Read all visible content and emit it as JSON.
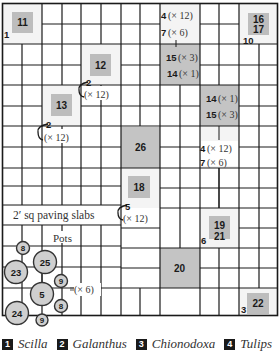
{
  "diagram": {
    "paving_label": "2′ sq paving slabs",
    "pots_label": "Pots",
    "colors": {
      "grid_line": "#1a1a1a",
      "block_fill": "#c4c4c4",
      "plot_white": "#f4f4f4",
      "pot_fill": "#cfcfcf"
    },
    "blocks": [
      {
        "id": "11",
        "text": "11"
      },
      {
        "id": "12",
        "text": "12"
      },
      {
        "id": "13",
        "text": "13"
      },
      {
        "id": "16-17",
        "line1": "16",
        "line2": "17"
      },
      {
        "id": "15-14-top",
        "line1": "15",
        "line1_qty": "(× 3)",
        "line2": "14",
        "line2_qty": "(× 1)"
      },
      {
        "id": "14-15-right",
        "line1": "14",
        "line1_qty": "(× 1)",
        "line2": "15",
        "line2_qty": "(× 3)"
      },
      {
        "id": "26",
        "text": "26"
      },
      {
        "id": "18",
        "text": "18"
      },
      {
        "id": "19-21",
        "line1": "19",
        "line2": "21"
      },
      {
        "id": "20",
        "text": "20"
      },
      {
        "id": "22",
        "text": "22"
      }
    ],
    "bed_annotations": {
      "top_center": {
        "line1": "4",
        "line1_qty": "(× 12)",
        "line2": "7",
        "line2_qty": "(× 6)"
      },
      "mid_right": {
        "line1": "4",
        "line1_qty": "(× 12)",
        "line2": "7",
        "line2_qty": "(× 6)"
      },
      "bulb_2a": {
        "num": "2",
        "qty": "(× 12)"
      },
      "bulb_2b": {
        "num": "2",
        "qty": "(× 12)"
      },
      "bulb_5": {
        "num": "5",
        "qty": "(× 12)"
      },
      "pots_qty": "(× 6)"
    },
    "corner_labels": {
      "c1": "1",
      "c10": "10",
      "c6": "6",
      "c3": "3"
    },
    "pots": [
      {
        "text": "8"
      },
      {
        "text": "25"
      },
      {
        "text": "23"
      },
      {
        "text": "9"
      },
      {
        "text": "5"
      },
      {
        "text": "8"
      },
      {
        "text": "24"
      },
      {
        "text": "9"
      }
    ]
  },
  "legend": [
    {
      "num": "1",
      "name": "Scilla"
    },
    {
      "num": "2",
      "name": "Galanthus"
    },
    {
      "num": "3",
      "name": "Chionodoxa"
    },
    {
      "num": "4",
      "name": "Tulips"
    }
  ]
}
